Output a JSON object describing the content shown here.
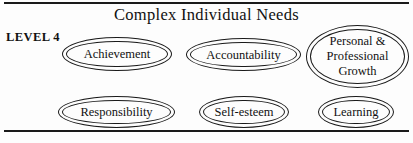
{
  "diagram": {
    "title": "Complex Individual Needs",
    "level_label": "LEVEL 4",
    "border_color": "#1a1a1a",
    "background_color": "#fdfdfd",
    "nodes": [
      {
        "id": "achievement",
        "label": "Achievement"
      },
      {
        "id": "accountability",
        "label": "Accountability"
      },
      {
        "id": "growth",
        "label": "Personal &\nProfessional\nGrowth"
      },
      {
        "id": "responsibility",
        "label": "Responsibility"
      },
      {
        "id": "self-esteem",
        "label": "Self-esteem"
      },
      {
        "id": "learning",
        "label": "Learning"
      }
    ]
  }
}
